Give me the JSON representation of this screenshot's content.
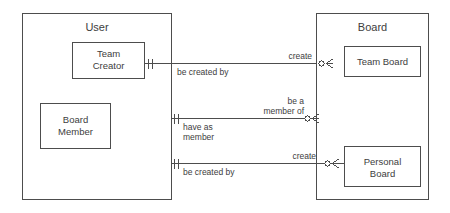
{
  "diagram": {
    "type": "entity-relationship-diagram",
    "notation": "crows-foot",
    "stroke_color": "#4d4d4d",
    "background_color": "#ffffff",
    "containers": [
      {
        "id": "user",
        "title": "User",
        "entities": [
          {
            "id": "team-creator",
            "lines": [
              "Team",
              "Creator"
            ]
          },
          {
            "id": "board-member",
            "lines": [
              "Board",
              "Member"
            ]
          }
        ]
      },
      {
        "id": "board",
        "title": "Board",
        "entities": [
          {
            "id": "team-board",
            "lines": [
              "Team Board"
            ]
          },
          {
            "id": "personal-board",
            "lines": [
              "Personal",
              "Board"
            ]
          }
        ]
      }
    ],
    "relationships": [
      {
        "id": "team-creator-creates-team-board",
        "from": "team-creator",
        "to": "team-board",
        "forward_label": "create",
        "reverse_label": "be created by",
        "from_cardinality": "exactly-one",
        "to_cardinality": "zero-or-many"
      },
      {
        "id": "board-member-member-of-team-board",
        "from": "board-member",
        "to": "team-board",
        "forward_label_lines": [
          "be a",
          "member of"
        ],
        "reverse_label_lines": [
          "have as",
          "member"
        ],
        "from_cardinality": "exactly-one",
        "to_cardinality": "zero-or-many"
      },
      {
        "id": "user-creates-personal-board",
        "from": "user",
        "to": "personal-board",
        "forward_label": "create",
        "reverse_label": "be created by",
        "from_cardinality": "exactly-one",
        "to_cardinality": "zero-or-many"
      }
    ]
  },
  "text": {
    "user_title": "User",
    "board_title": "Board",
    "team_creator_line1": "Team",
    "team_creator_line2": "Creator",
    "board_member_line1": "Board",
    "board_member_line2": "Member",
    "team_board_line1": "Team Board",
    "personal_board_line1": "Personal",
    "personal_board_line2": "Board",
    "rel1_forward": "create",
    "rel1_reverse": "be created by",
    "rel2_forward_line1": "be a",
    "rel2_forward_line2": "member of",
    "rel2_reverse_line1": "have as",
    "rel2_reverse_line2": "member",
    "rel3_forward": "create",
    "rel3_reverse": "be created by"
  }
}
